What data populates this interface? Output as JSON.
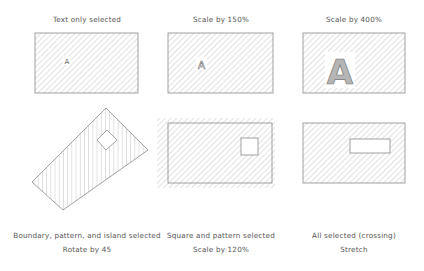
{
  "panels": [
    {
      "caption": [
        "Text only selected"
      ],
      "text_glyph": "A"
    },
    {
      "caption": [
        "Scale by 150%"
      ],
      "text_glyph": "A"
    },
    {
      "caption": [
        "Scale by 400%"
      ],
      "text_glyph": "A"
    },
    {
      "caption": [
        "Boundary, pattern, and island selected",
        "Rotate by 45"
      ]
    },
    {
      "caption": [
        "Square and pattern selected",
        "Scale by 120%"
      ]
    },
    {
      "caption": [
        "All selected (crossing)",
        "Stretch"
      ]
    }
  ],
  "colors": {
    "line": "#8a8a8a",
    "hatch": "#9a9a9a",
    "text": "#555555",
    "background": "#ffffff"
  }
}
